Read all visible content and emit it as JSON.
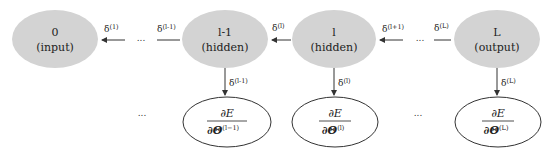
{
  "diagram": {
    "colors": {
      "layer_fill": "#d3d3d3",
      "grad_fill": "#ffffff",
      "stroke": "#333333",
      "text": "#222222"
    },
    "layers": [
      {
        "id": "layer-0",
        "index": "0",
        "role": "(input)"
      },
      {
        "id": "layer-l-1",
        "index": "l-1",
        "role": "(hidden)"
      },
      {
        "id": "layer-l",
        "index": "l",
        "role": "(hidden)"
      },
      {
        "id": "layer-L",
        "index": "L",
        "role": "(output)"
      }
    ],
    "horizontal_deltas": [
      {
        "base": "δ",
        "sup": "(1)"
      },
      {
        "base": "δ",
        "sup": "(l-1)"
      },
      {
        "base": "δ",
        "sup": "(l)"
      },
      {
        "base": "δ",
        "sup": "(l+1)"
      },
      {
        "base": "δ",
        "sup": "(L)"
      }
    ],
    "vertical_deltas": [
      {
        "base": "δ",
        "sup": "(l-1)"
      },
      {
        "base": "δ",
        "sup": "(l)"
      },
      {
        "base": "δ",
        "sup": "(L)"
      }
    ],
    "gradients": [
      {
        "num": "∂E",
        "den": "∂Θ",
        "sup": "(l−1)"
      },
      {
        "num": "∂E",
        "den": "∂Θ",
        "sup": "(l)"
      },
      {
        "num": "∂E",
        "den": "∂Θ",
        "sup": "(L)"
      }
    ],
    "ellipsis": "..."
  }
}
